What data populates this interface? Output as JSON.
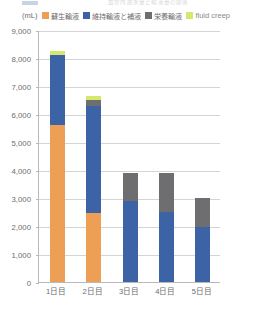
{
  "top_artifact": {
    "text": "血管内脱水量と輸液量の関係",
    "swatch_color": "#4a6fb0"
  },
  "legend": {
    "unit_label": "(mL)",
    "items": [
      {
        "label": "蘇生輸液",
        "color": "#ee9f56",
        "latin": false
      },
      {
        "label": "維持輸液と補液",
        "color": "#3c63a6",
        "latin": false
      },
      {
        "label": "栄養輸液",
        "color": "#6e6e70",
        "latin": false
      },
      {
        "label": "fluid creep",
        "color": "#d4e86b",
        "latin": true
      }
    ]
  },
  "axes": {
    "y_ticks": [
      "9,000",
      "8,000",
      "7,000",
      "6,000",
      "5,000",
      "4,000",
      "3,000",
      "2,000",
      "1,000",
      "0"
    ],
    "y_values": [
      9000,
      8000,
      7000,
      6000,
      5000,
      4000,
      3000,
      2000,
      1000,
      0
    ],
    "y_unit": "(mL)",
    "x_ticks": [
      "1日目",
      "2日目",
      "3日目",
      "4日目",
      "5日目"
    ]
  },
  "chart_data": {
    "type": "bar",
    "subtype": "stacked-column",
    "title": "",
    "xlabel": "",
    "ylabel": "(mL)",
    "ylim": [
      0,
      9000
    ],
    "ytick_step": 1000,
    "grid": true,
    "legend_position": "top",
    "categories": [
      "1日目",
      "2日目",
      "3日目",
      "4日目",
      "5日目"
    ],
    "series": [
      {
        "name": "蘇生輸液",
        "color": "#ee9f56",
        "values": [
          5600,
          2450,
          0,
          0,
          0
        ]
      },
      {
        "name": "維持輸液と補液",
        "color": "#3c63a6",
        "values": [
          2500,
          3850,
          2900,
          2500,
          1950
        ]
      },
      {
        "name": "栄養輸液",
        "color": "#6e6e70",
        "values": [
          0,
          200,
          1000,
          1400,
          1050
        ]
      },
      {
        "name": "fluid creep",
        "color": "#d4e86b",
        "values": [
          150,
          150,
          0,
          0,
          0
        ]
      }
    ],
    "totals": [
      8250,
      6650,
      3900,
      3900,
      3000
    ]
  }
}
